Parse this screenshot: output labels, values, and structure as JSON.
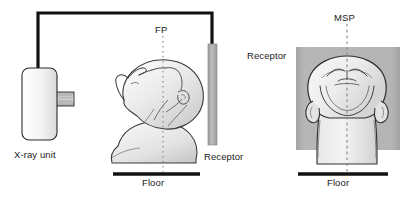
{
  "figure": {
    "width": 411,
    "height": 208,
    "background_color": "#ffffff"
  },
  "colors": {
    "line": "#1a1a1a",
    "text": "#1a1a1a",
    "receptor_gray": "#a8a8a8",
    "receptor_panel_gray": "#b0b0b0",
    "body_light": "#f2f2f2",
    "body_shade": "#d8d8d8",
    "dashed_line": "#8a8a8a"
  },
  "panels": {
    "left": {
      "name": "lateral-projection-view",
      "xray_unit": {
        "label": "X-ray unit",
        "body_x": 22,
        "body_y": 68,
        "body_width": 35,
        "body_height": 72,
        "collimator_x": 57,
        "collimator_y": 92,
        "collimator_width": 17,
        "collimator_height": 14
      },
      "support_arm": {
        "name": "support-arm",
        "from_x": 38,
        "top_y": 13,
        "to_x": 212,
        "stroke_width": 3.2
      },
      "plane_line": {
        "label": "FP",
        "full_name": "Frankfort plane",
        "x": 163,
        "y_top": 36,
        "y_bottom": 172
      },
      "receptor": {
        "label": "Receptor",
        "x": 208,
        "y": 44,
        "width": 9,
        "height": 101
      },
      "floor": {
        "label": "Floor",
        "x_start": 113,
        "x_end": 200,
        "y": 174,
        "stroke_width": 3.4
      },
      "subject": "head-lateral-profile-tilted-back"
    },
    "right": {
      "name": "frontal-projection-view",
      "receptor": {
        "label": "Receptor",
        "x": 296,
        "y": 47,
        "width": 104,
        "height": 103
      },
      "plane_line": {
        "label": "MSP",
        "full_name": "Mid-sagittal plane",
        "x": 347,
        "y_top": 24,
        "y_bottom": 172
      },
      "floor": {
        "label": "Floor",
        "x_start": 298,
        "x_end": 388,
        "y": 174,
        "stroke_width": 3.4
      },
      "subject": "head-neck-frontal-view"
    }
  }
}
